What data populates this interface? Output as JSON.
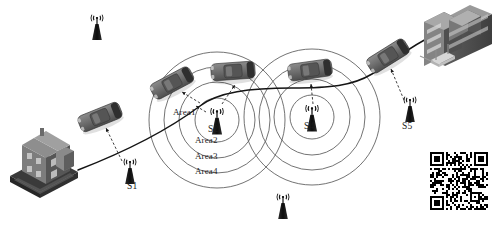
{
  "diagram": {
    "background_color": "#ffffff",
    "line_color": "#1b1b1b",
    "circle_color": "#555555",
    "car_body_color": "#6e6e6e",
    "car_dark_color": "#3f3f3f",
    "tower_color": "#171717",
    "building_color": "#7a7a7a",
    "building_dark_color": "#4a4a4a"
  },
  "towers": [
    {
      "id": "t0",
      "label": "",
      "x": 97,
      "y": 28,
      "scale": 1.0,
      "labeled": false
    },
    {
      "id": "t1",
      "label": "S1",
      "x": 130,
      "y": 172,
      "scale": 1.0,
      "labeled": true
    },
    {
      "id": "t2",
      "label": "S2",
      "x": 217,
      "y": 122,
      "scale": 1.05,
      "labeled": true
    },
    {
      "id": "t3",
      "label": "",
      "x": 283,
      "y": 207,
      "scale": 1.0,
      "labeled": false
    },
    {
      "id": "t4",
      "label": "S4",
      "x": 312,
      "y": 119,
      "scale": 1.05,
      "labeled": true
    },
    {
      "id": "t5",
      "label": "S5",
      "x": 410,
      "y": 110,
      "scale": 1.0,
      "labeled": true
    }
  ],
  "coverage": {
    "rings": [
      {
        "name": "Area1",
        "radius": 22
      },
      {
        "name": "Area2",
        "radius": 38
      },
      {
        "name": "Area3",
        "radius": 53
      },
      {
        "name": "Area4",
        "radius": 68
      }
    ],
    "centers": [
      {
        "tower": "S2",
        "cx": 217,
        "cy": 120
      },
      {
        "tower": "S4",
        "cx": 312,
        "cy": 117
      }
    ]
  },
  "area_labels": [
    {
      "text": "Area1",
      "x": 182,
      "y": 113
    },
    {
      "text": "Area2",
      "x": 203,
      "y": 140
    },
    {
      "text": "Area3",
      "x": 203,
      "y": 156
    },
    {
      "text": "Area4",
      "x": 203,
      "y": 171
    }
  ],
  "tower_labels": [
    {
      "text": "S1",
      "x": 133,
      "y": 188
    },
    {
      "text": "S2",
      "x": 212,
      "y": 130
    },
    {
      "text": "S4",
      "x": 307,
      "y": 128
    },
    {
      "text": "S5",
      "x": 406,
      "y": 127
    }
  ],
  "cars": [
    {
      "id": "c1",
      "x": 100,
      "y": 117,
      "angle": -22,
      "desc": "car-near-house"
    },
    {
      "id": "c2",
      "x": 172,
      "y": 83,
      "angle": -28,
      "desc": "car-entering-S2"
    },
    {
      "id": "c3",
      "x": 233,
      "y": 71,
      "angle": -4,
      "desc": "car-above-S2"
    },
    {
      "id": "c4",
      "x": 310,
      "y": 70,
      "angle": -8,
      "desc": "car-above-S4"
    },
    {
      "id": "c5",
      "x": 388,
      "y": 56,
      "angle": -32,
      "desc": "car-near-office"
    }
  ],
  "buildings": [
    {
      "id": "house",
      "name": "residential-house",
      "x": 8,
      "y": 128,
      "w": 66,
      "h": 62
    },
    {
      "id": "office",
      "name": "office-building",
      "x": 420,
      "y": 4,
      "w": 72,
      "h": 58
    }
  ],
  "qr_code": {
    "name": "qr-code",
    "x": 430,
    "y": 152,
    "size": 58,
    "modules": 29,
    "foreground": "#000000",
    "background": "#ffffff"
  },
  "road": {
    "name": "road-path",
    "description": "Road from house up through S2 and S4 coverage to office building"
  },
  "signal_links": [
    {
      "from": "c1",
      "to": "S1"
    },
    {
      "from": "c2",
      "to": "S2"
    },
    {
      "from": "c3",
      "to": "S2"
    },
    {
      "from": "c4",
      "to": "S4"
    },
    {
      "from": "c5",
      "to": "S5"
    }
  ]
}
